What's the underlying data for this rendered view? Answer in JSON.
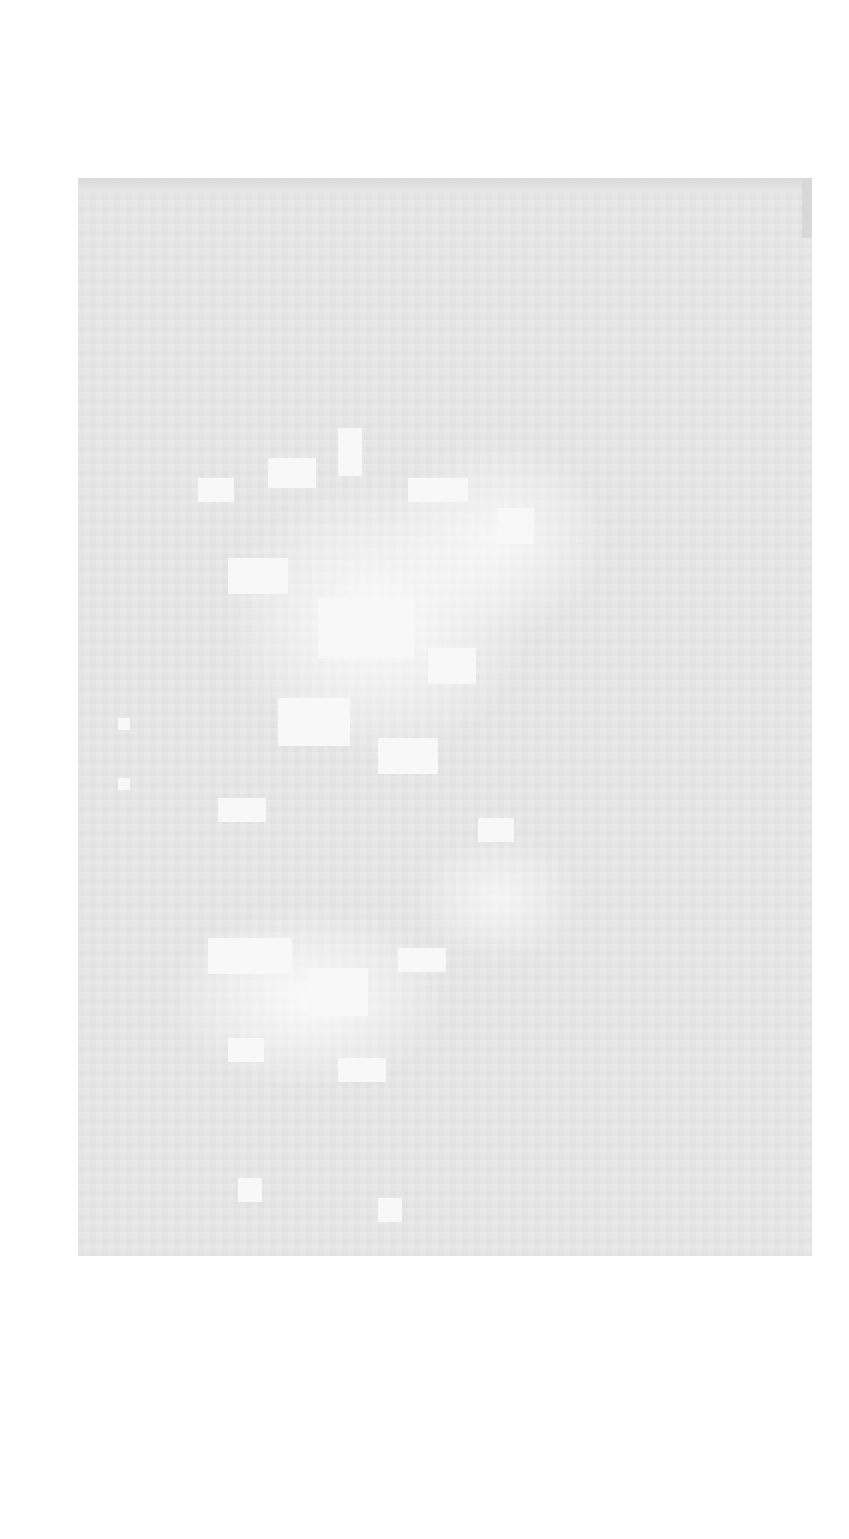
{
  "document": {
    "type": "scanned-page",
    "legible_text": "",
    "colors": {
      "page_background": "#e9e9e9",
      "highlight_blotches": "#f8f8f8",
      "surround": "#ffffff"
    }
  }
}
